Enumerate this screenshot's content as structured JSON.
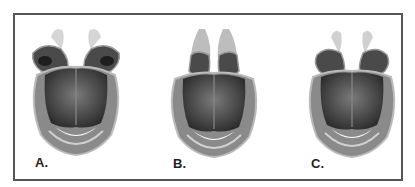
{
  "figure": {
    "type": "anatomical illustration",
    "border_color": "#555555",
    "panels": [
      {
        "label": "A.",
        "variant": "wide-splayed"
      },
      {
        "label": "B.",
        "variant": "upright-narrow"
      },
      {
        "label": "C.",
        "variant": "intermediate"
      }
    ]
  }
}
